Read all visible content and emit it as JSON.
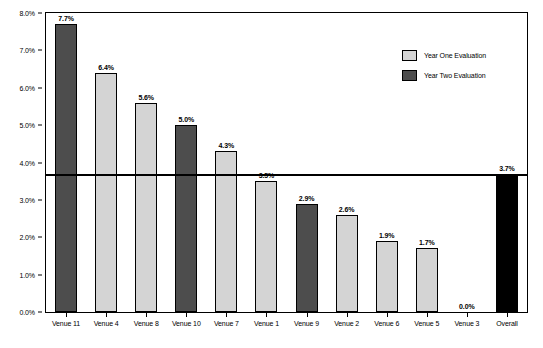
{
  "chart_data": {
    "type": "bar",
    "title": "",
    "xlabel": "",
    "ylabel": "",
    "ylim": [
      0.0,
      8.0
    ],
    "grid": false,
    "legend_position": "top-right",
    "categories": [
      "Venue 11",
      "Venue 4",
      "Venue 8",
      "Venue 10",
      "Venue 7",
      "Venue 1",
      "Venue 9",
      "Venue 2",
      "Venue 6",
      "Venue 5",
      "Venue 3",
      "Overall"
    ],
    "values": [
      7.7,
      6.4,
      5.6,
      5.0,
      4.3,
      3.5,
      2.9,
      2.6,
      1.9,
      1.7,
      0.0,
      3.7
    ],
    "value_labels": [
      "7.7%",
      "6.4%",
      "5.6%",
      "5.0%",
      "4.3%",
      "3.5%",
      "2.9%",
      "2.6%",
      "1.9%",
      "1.7%",
      "0.0%",
      "3.7%"
    ],
    "series_of_bar": [
      "Year Two Evaluation",
      "Year One Evaluation",
      "Year One Evaluation",
      "Year Two Evaluation",
      "Year One Evaluation",
      "Year One Evaluation",
      "Year Two Evaluation",
      "Year One Evaluation",
      "Year One Evaluation",
      "Year One Evaluation",
      "Year One Evaluation",
      "Overall"
    ],
    "bar_colors": [
      "#4d4d4d",
      "#d4d4d4",
      "#d4d4d4",
      "#4d4d4d",
      "#d4d4d4",
      "#d4d4d4",
      "#4d4d4d",
      "#d4d4d4",
      "#d4d4d4",
      "#d4d4d4",
      "#d4d4d4",
      "#000000"
    ],
    "ytick_labels": [
      "0.0%",
      "1.0%",
      "2.0%",
      "3.0%",
      "4.0%",
      "5.0%",
      "6.0%",
      "7.0%",
      "8.0%"
    ],
    "ytick_values": [
      0.0,
      1.0,
      2.0,
      3.0,
      4.0,
      5.0,
      6.0,
      7.0,
      8.0
    ],
    "reference_line": {
      "value": 3.7,
      "label": "3.7%"
    },
    "legend": [
      {
        "label": "Year One Evaluation",
        "color": "#d4d4d4"
      },
      {
        "label": "Year Two Evaluation",
        "color": "#4d4d4d"
      }
    ]
  },
  "footer": {
    "caption": ""
  }
}
